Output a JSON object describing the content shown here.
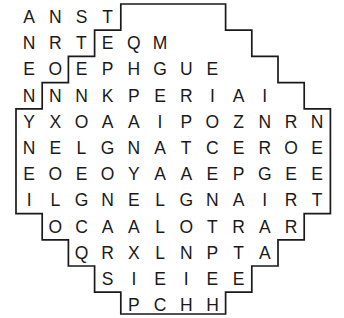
{
  "puzzle": {
    "title": "Word Search Grid",
    "shape": "octagon",
    "row_count": 12,
    "max_columns": 12,
    "cell_size_px": 26,
    "border_color": "#1a1a1a",
    "letter_color": "#1a1a1a",
    "background_color": "#ffffff",
    "rows": [
      {
        "index": 1,
        "offset": 4,
        "length": 4,
        "letters": [
          "A",
          "N",
          "S",
          "T"
        ]
      },
      {
        "index": 2,
        "offset": 3,
        "length": 6,
        "letters": [
          "N",
          "R",
          "T",
          "E",
          "Q",
          "M"
        ]
      },
      {
        "index": 3,
        "offset": 2,
        "length": 8,
        "letters": [
          "E",
          "O",
          "E",
          "P",
          "H",
          "G",
          "U",
          "E"
        ]
      },
      {
        "index": 4,
        "offset": 1,
        "length": 10,
        "letters": [
          "N",
          "N",
          "N",
          "K",
          "P",
          "E",
          "R",
          "I",
          "A",
          "I"
        ]
      },
      {
        "index": 5,
        "offset": 0,
        "length": 12,
        "letters": [
          "Y",
          "X",
          "O",
          "A",
          "A",
          "I",
          "P",
          "O",
          "Z",
          "N",
          "R",
          "N"
        ]
      },
      {
        "index": 6,
        "offset": 0,
        "length": 12,
        "letters": [
          "N",
          "E",
          "L",
          "G",
          "N",
          "A",
          "T",
          "C",
          "E",
          "R",
          "O",
          "E"
        ]
      },
      {
        "index": 7,
        "offset": 0,
        "length": 12,
        "letters": [
          "E",
          "O",
          "E",
          "O",
          "Y",
          "A",
          "A",
          "E",
          "P",
          "G",
          "E",
          "E"
        ]
      },
      {
        "index": 8,
        "offset": 0,
        "length": 12,
        "letters": [
          "I",
          "L",
          "G",
          "N",
          "E",
          "L",
          "G",
          "N",
          "A",
          "I",
          "R",
          "T"
        ]
      },
      {
        "index": 9,
        "offset": 1,
        "length": 10,
        "letters": [
          "O",
          "C",
          "A",
          "A",
          "L",
          "O",
          "T",
          "R",
          "A",
          "R"
        ]
      },
      {
        "index": 10,
        "offset": 2,
        "length": 8,
        "letters": [
          "Q",
          "R",
          "X",
          "L",
          "N",
          "P",
          "T",
          "A"
        ]
      },
      {
        "index": 11,
        "offset": 3,
        "length": 6,
        "letters": [
          "S",
          "I",
          "E",
          "I",
          "E",
          "E"
        ]
      },
      {
        "index": 12,
        "offset": 4,
        "length": 4,
        "letters": [
          "P",
          "C",
          "H",
          "H"
        ]
      }
    ]
  }
}
